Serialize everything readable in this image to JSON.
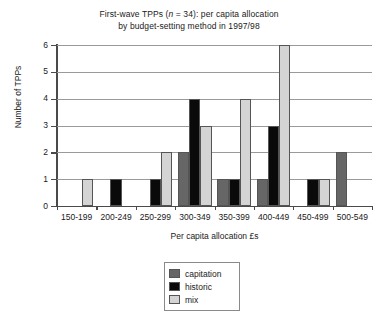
{
  "chart_data": {
    "type": "bar",
    "title": "First-wave TPPs (n = 34): per capita allocation by budget-setting method in 1997/98",
    "title_line1_pre": "First-wave TPPs (",
    "title_line1_ital": "n",
    "title_line1_post": " = 34): per capita allocation",
    "title_line2": "by budget-setting method in 1997/98",
    "xlabel": "Per capita allocation £s",
    "ylabel": "Number of TPPs",
    "ylim": [
      0,
      6
    ],
    "yticks": [
      "0",
      "1",
      "2",
      "3",
      "4",
      "5",
      "6"
    ],
    "grid": true,
    "legend_position": "bottom-center",
    "categories": [
      "150-199",
      "200-249",
      "250-299",
      "300-349",
      "350-399",
      "400-449",
      "450-499",
      "500-549"
    ],
    "series": [
      {
        "name": "capitation",
        "color": "#666666",
        "values": [
          0,
          0,
          0,
          2,
          1,
          1,
          0,
          2
        ]
      },
      {
        "name": "historic",
        "color": "#0a0a0a",
        "values": [
          0,
          1,
          1,
          4,
          1,
          3,
          1,
          0
        ]
      },
      {
        "name": "mix",
        "color": "#d4d4d4",
        "values": [
          1,
          0,
          2,
          3,
          4,
          6,
          1,
          0
        ]
      }
    ],
    "total_n": 34
  },
  "legend": {
    "items": [
      {
        "label": "capitation"
      },
      {
        "label": "historic"
      },
      {
        "label": "mix"
      }
    ]
  }
}
